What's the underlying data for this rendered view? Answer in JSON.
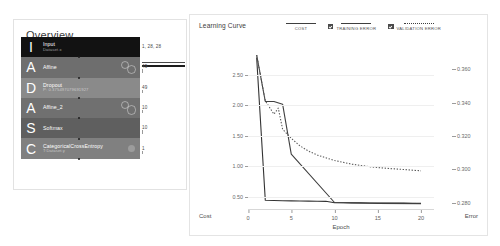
{
  "overview": {
    "title": "Overview",
    "layers": [
      {
        "initial": "I",
        "name": "Input",
        "sub": "Dataset.x",
        "bg": "#121212",
        "badge": "none",
        "dim": "1, 28, 28"
      },
      {
        "initial": "A",
        "name": "Affine",
        "sub": "",
        "bg": "#6e6e6e",
        "badge": "rings",
        "dim": "49"
      },
      {
        "initial": "D",
        "name": "Dropout",
        "sub": "P: 0.375497079691927",
        "bg": "#8a8a8a",
        "badge": "none",
        "dim": "49"
      },
      {
        "initial": "A",
        "name": "Affine_2",
        "sub": "",
        "bg": "#707070",
        "badge": "rings",
        "dim": "10"
      },
      {
        "initial": "S",
        "name": "Softmax",
        "sub": "",
        "bg": "#5f5f5f",
        "badge": "none",
        "dim": "10"
      },
      {
        "initial": "C",
        "name": "CategoricalCrossEntropy",
        "sub": "T:Dataset.y",
        "bg": "#808080",
        "badge": "solid",
        "dim": "1"
      }
    ]
  },
  "chart_panel": {
    "title": "Learning Curve",
    "legend": [
      {
        "label": "COST",
        "style": "solid",
        "checkbox": false
      },
      {
        "label": "TRAINING ERROR",
        "style": "solid",
        "checkbox": true
      },
      {
        "label": "VALIDATION ERROR",
        "style": "dotted",
        "checkbox": true
      }
    ],
    "axis_left_label": "Cost",
    "axis_right_label": "Error",
    "axis_x_label": "Epoch"
  },
  "chart_data": {
    "type": "line",
    "title": "Learning Curve",
    "xlabel": "Epoch",
    "ylabel": "Cost",
    "y2label": "Error",
    "xlim": [
      0,
      21.5
    ],
    "ylim": [
      0.28,
      2.82
    ],
    "y2lim": [
      0.2755,
      0.3685
    ],
    "xticks": [
      0,
      5,
      10,
      15,
      20
    ],
    "yticks": [
      0.5,
      1.0,
      1.5,
      2.0,
      2.5
    ],
    "y2ticks": [
      0.28,
      0.3,
      0.32,
      0.34,
      0.36
    ],
    "grid": true,
    "legend_position": "top",
    "series": [
      {
        "name": "COST",
        "axis": "left",
        "style": "solid",
        "color": "#333333",
        "x": [
          1,
          2,
          3,
          4,
          5,
          6,
          7,
          8,
          9,
          10,
          11,
          12,
          13,
          14,
          15,
          16,
          17,
          18,
          19,
          20
        ],
        "y": [
          2.78,
          0.44,
          0.435,
          0.432,
          0.43,
          0.428,
          0.426,
          0.424,
          0.422,
          0.4,
          0.398,
          0.397,
          0.396,
          0.395,
          0.394,
          0.393,
          0.392,
          0.392,
          0.391,
          0.391
        ]
      },
      {
        "name": "TRAINING ERROR",
        "axis": "right",
        "style": "solid",
        "color": "#3f3f3f",
        "x": [
          1,
          2,
          3,
          4,
          5,
          10,
          15,
          20
        ],
        "y": [
          0.3685,
          0.3406,
          0.3406,
          0.339,
          0.309,
          0.28,
          0.2795,
          0.2793
        ]
      },
      {
        "name": "VALIDATION ERROR",
        "axis": "right",
        "style": "dotted",
        "color": "#5a5a5a",
        "x": [
          1,
          2,
          3,
          3.5,
          4,
          5,
          6,
          7,
          8,
          9,
          10,
          12,
          14,
          16,
          18,
          20
        ],
        "y": [
          0.3685,
          0.341,
          0.333,
          0.3366,
          0.324,
          0.3185,
          0.314,
          0.3108,
          0.3085,
          0.3068,
          0.3052,
          0.303,
          0.3015,
          0.3005,
          0.2998,
          0.299
        ]
      }
    ]
  }
}
